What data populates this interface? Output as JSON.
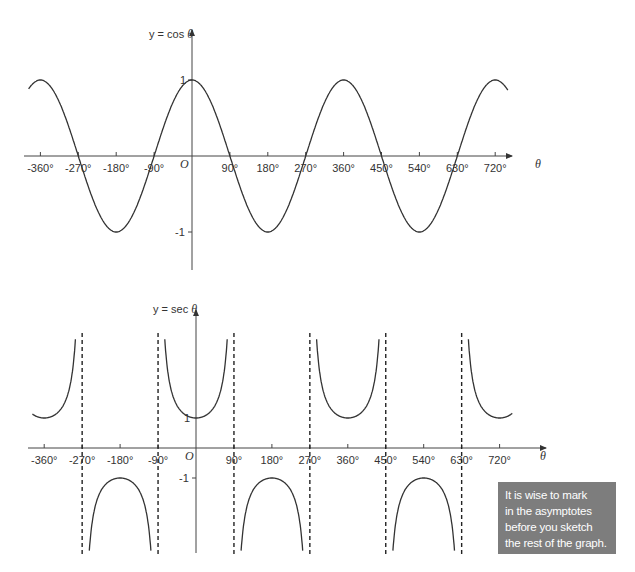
{
  "chart_data": [
    {
      "type": "line",
      "title": "y = cos θ",
      "ylabel": "y = cos θ",
      "xlabel": "θ",
      "function": "cos",
      "x_ticks": [
        -360,
        -270,
        -180,
        -90,
        90,
        180,
        270,
        360,
        450,
        540,
        630,
        720
      ],
      "x_tick_labels": [
        "-360°",
        "-270°",
        "-180°",
        "-90°",
        "90°",
        "180°",
        "270°",
        "360°",
        "450°",
        "540°",
        "630°",
        "720°"
      ],
      "y_ticks": [
        1,
        -1
      ],
      "y_tick_labels": [
        "1",
        "-1"
      ],
      "origin_label": "O",
      "xlim": [
        -390,
        750
      ],
      "ylim": [
        -1.5,
        1.5
      ],
      "grid": false,
      "x": [
        -390,
        -360,
        -270,
        -180,
        -90,
        0,
        90,
        180,
        270,
        360,
        450,
        540,
        630,
        720,
        750
      ],
      "values": [
        0.87,
        1,
        0,
        -1,
        0,
        1,
        0,
        -1,
        0,
        1,
        0,
        -1,
        0,
        1,
        0.87
      ]
    },
    {
      "type": "line",
      "title": "y = sec θ",
      "ylabel": "y = sec θ",
      "xlabel": "θ",
      "function": "sec",
      "x_ticks": [
        -360,
        -270,
        -180,
        -90,
        90,
        180,
        270,
        360,
        450,
        540,
        630,
        720
      ],
      "x_tick_labels": [
        "-360°",
        "-270°",
        "-180°",
        "-90°",
        "90°",
        "180°",
        "270°",
        "360°",
        "450°",
        "540°",
        "630°",
        "720°"
      ],
      "y_ticks": [
        1,
        -1
      ],
      "y_tick_labels": [
        "1",
        "-1"
      ],
      "origin_label": "O",
      "asymptotes": [
        -270,
        -90,
        90,
        270,
        450,
        630
      ],
      "xlim": [
        -390,
        750
      ],
      "grid": false,
      "x": [
        -360,
        -180,
        0,
        180,
        360,
        540,
        720
      ],
      "values": [
        1,
        -1,
        1,
        -1,
        1,
        -1,
        1
      ]
    }
  ],
  "top_chart": {
    "y_label": "y = cos θ",
    "x_label": "θ",
    "origin": "O",
    "y_tick_1": "1",
    "y_tick_neg1": "-1",
    "x_ticks": [
      "-360°",
      "-270°",
      "-180°",
      "-90°",
      "90°",
      "180°",
      "270°",
      "360°",
      "450°",
      "540°",
      "630°",
      "720°"
    ]
  },
  "bottom_chart": {
    "y_label": "y = sec θ",
    "x_label": "θ",
    "origin": "O",
    "y_tick_1": "1",
    "y_tick_neg1": "-1",
    "x_ticks": [
      "-360°",
      "-270°",
      "-180°",
      "-90°",
      "90°",
      "180°",
      "270°",
      "360°",
      "450°",
      "540°",
      "630°",
      "720°"
    ]
  },
  "note": {
    "lines": [
      "It is wise to mark",
      "in the asymptotes",
      "before you sketch",
      "the rest of the graph."
    ],
    "background": "#7d7d7d"
  }
}
